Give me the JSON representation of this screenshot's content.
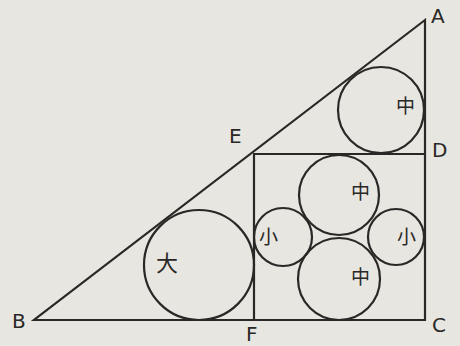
{
  "diagram": {
    "type": "geometry",
    "points": {
      "A": {
        "label": "A",
        "x": 425,
        "y": 20
      },
      "B": {
        "label": "B",
        "x": 34,
        "y": 320
      },
      "C": {
        "label": "C",
        "x": 425,
        "y": 320
      },
      "D": {
        "label": "D",
        "x": 425,
        "y": 154
      },
      "E": {
        "label": "E",
        "x": 254,
        "y": 154
      },
      "F": {
        "label": "F",
        "x": 254,
        "y": 320
      }
    },
    "circles": [
      {
        "id": "large",
        "label": "大",
        "cx": 199,
        "cy": 265,
        "r": 55
      },
      {
        "id": "medium-top",
        "label": "中",
        "cx": 381,
        "cy": 110,
        "r": 43
      },
      {
        "id": "medium-upper",
        "label": "中",
        "cx": 339,
        "cy": 195,
        "r": 40
      },
      {
        "id": "medium-lower",
        "label": "中",
        "cx": 339,
        "cy": 279,
        "r": 41
      },
      {
        "id": "small-left",
        "label": "小",
        "cx": 283,
        "cy": 237,
        "r": 29
      },
      {
        "id": "small-right",
        "label": "小",
        "cx": 396,
        "cy": 237,
        "r": 28
      }
    ],
    "colors": {
      "background": "#e7e6e1",
      "stroke": "#2a2826"
    }
  }
}
